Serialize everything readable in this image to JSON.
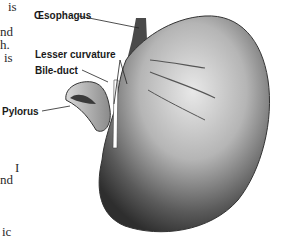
{
  "figure": {
    "labels": [
      {
        "id": "oesophagus",
        "text": "Œsophagus"
      },
      {
        "id": "lesser-curvature",
        "text": "Lesser curvature"
      },
      {
        "id": "bile-duct",
        "text": "Bile-duct"
      },
      {
        "id": "pylorus",
        "text": "Pylorus"
      }
    ]
  },
  "text_fragments": [
    "is",
    "nd",
    "h.",
    "is",
    "I",
    "nd",
    "ic"
  ],
  "colors": {
    "background": "#ffffff",
    "ink": "#1a1a1a"
  }
}
